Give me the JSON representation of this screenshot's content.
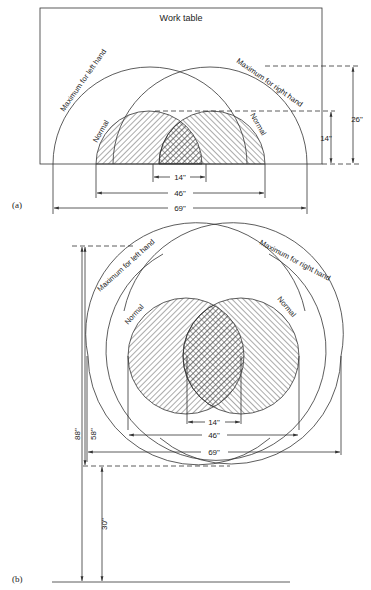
{
  "figure_a": {
    "label": "(a)",
    "title": "Work table",
    "max_left": "Maximum for left hand",
    "max_right": "Maximum for right hand",
    "normal_left": "Normal",
    "normal_right": "Normal",
    "dims": {
      "d14w": "14\"",
      "d46": "46\"",
      "d69": "69\"",
      "d14h": "14\"",
      "d26": "26\""
    }
  },
  "figure_b": {
    "label": "(b)",
    "max_left": "Maximum for left hand",
    "max_right": "Maximum for right hand",
    "normal_left": "Normal",
    "normal_right": "Normal",
    "dims": {
      "d14": "14\"",
      "d46": "46\"",
      "d69": "69\"",
      "d88": "88\"",
      "d58": "58\"",
      "d30": "30\""
    }
  },
  "colors": {
    "line": "#333333",
    "background": "#ffffff"
  }
}
